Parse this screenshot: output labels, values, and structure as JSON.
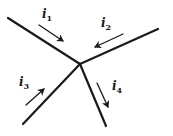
{
  "diagram": {
    "junction": {
      "x": 80,
      "y": 64
    },
    "color": "#1a1a1a",
    "branches": [
      {
        "id": "1",
        "label": "i",
        "subscript": "1",
        "direction": "into junction",
        "wire": {
          "x1": 8,
          "y1": 18
        },
        "arrow": {
          "x1": 39,
          "y1": 25,
          "x2": 63,
          "y2": 41
        },
        "label_pos": {
          "x": 42,
          "y": 8
        }
      },
      {
        "id": "2",
        "label": "i",
        "subscript": "2",
        "direction": "into junction",
        "wire": {
          "x1": 158,
          "y1": 29
        },
        "arrow": {
          "x1": 123,
          "y1": 34,
          "x2": 95,
          "y2": 47
        },
        "label_pos": {
          "x": 101,
          "y": 17
        }
      },
      {
        "id": "3",
        "label": "i",
        "subscript": "3",
        "direction": "into junction",
        "wire": {
          "x1": 23,
          "y1": 124
        },
        "arrow": {
          "x1": 26,
          "y1": 105,
          "x2": 44,
          "y2": 89
        },
        "label_pos": {
          "x": 19,
          "y": 76
        }
      },
      {
        "id": "4",
        "label": "i",
        "subscript": "4",
        "direction": "out of junction",
        "wire": {
          "x1": 106,
          "y1": 126
        },
        "arrow": {
          "x1": 97,
          "y1": 83,
          "x2": 108,
          "y2": 107
        },
        "label_pos": {
          "x": 112,
          "y": 80
        }
      }
    ]
  }
}
